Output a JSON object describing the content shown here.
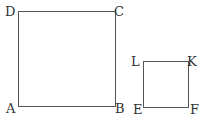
{
  "figure": {
    "squares": [
      {
        "name": "ABCD",
        "vertices": {
          "bottom_left": "A",
          "bottom_right": "B",
          "top_right": "C",
          "top_left": "D"
        }
      },
      {
        "name": "EFKL",
        "vertices": {
          "bottom_left": "E",
          "bottom_right": "F",
          "top_right": "K",
          "top_left": "L"
        }
      }
    ],
    "colors": {
      "line": "#555555",
      "text": "#333333",
      "background": "#ffffff"
    }
  }
}
